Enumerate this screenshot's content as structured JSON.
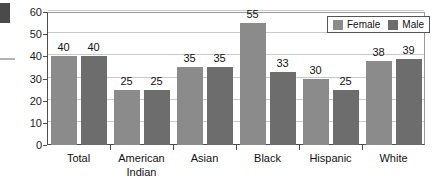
{
  "chart_data": {
    "type": "bar",
    "title": "",
    "subtitle": "",
    "xlabel": "",
    "ylabel": "",
    "ylim": [
      0,
      60
    ],
    "yticks": [
      0,
      10,
      20,
      30,
      40,
      50,
      60
    ],
    "ytick_labels": [
      "0",
      "10",
      "20",
      "30",
      "40",
      "50",
      "60"
    ],
    "grid": true,
    "grid_axis": "y",
    "legend_position": "top-right",
    "categories": [
      "Total",
      "American Indian",
      "Asian",
      "Black",
      "Hispanic",
      "White"
    ],
    "category_label_lines": [
      [
        "Total"
      ],
      [
        "American",
        "Indian"
      ],
      [
        "Asian"
      ],
      [
        "Black"
      ],
      [
        "Hispanic"
      ],
      [
        "White"
      ]
    ],
    "series": [
      {
        "name": "Female",
        "color": "#8b8b8b",
        "values": [
          40,
          25,
          35,
          55,
          30,
          38
        ],
        "value_labels": [
          "40",
          "25",
          "35",
          "55",
          "30",
          "38"
        ]
      },
      {
        "name": "Male",
        "color": "#6d6d6d",
        "values": [
          40,
          25,
          35,
          33,
          25,
          39
        ],
        "value_labels": [
          "40",
          "25",
          "35",
          "33",
          "25",
          "39"
        ]
      }
    ]
  },
  "legend": {
    "entries": [
      {
        "label": "Female",
        "color": "#8b8b8b",
        "swatch_name": "female-swatch"
      },
      {
        "label": "Male",
        "color": "#6d6d6d",
        "swatch_name": "male-swatch"
      }
    ]
  },
  "colors": {
    "female_bar": "#8b8b8b",
    "male_bar": "#6d6d6d",
    "gridline": "#c9c9c9",
    "axis": "#4d4d4d",
    "plot_background": "#ffffff",
    "text": "#121212",
    "page_background": "#ffffff"
  }
}
